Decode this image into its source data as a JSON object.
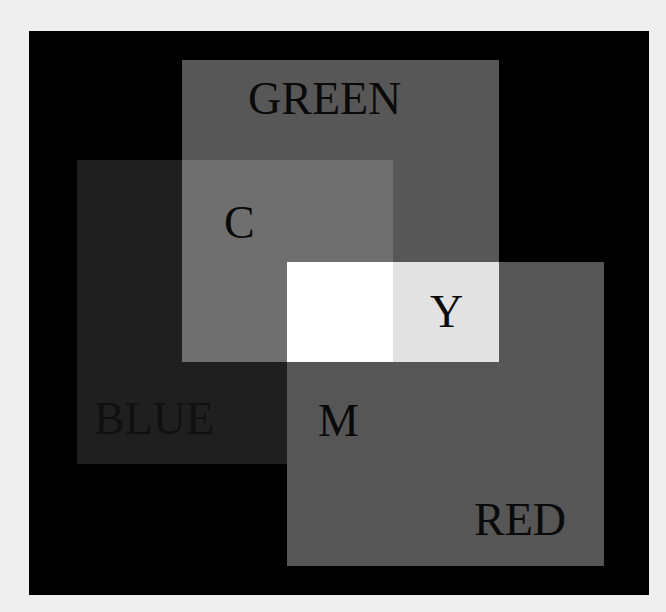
{
  "diagram": {
    "title": "",
    "labels": {
      "green": "GREEN",
      "blue": "BLUE",
      "red": "RED",
      "cyan": "C",
      "yellow": "Y",
      "magenta": "M"
    },
    "colors": {
      "page_background": "#efefef",
      "frame": "#000000",
      "green_only": "#575757",
      "blue_only": "#1f1f1f",
      "red_only": "#565656",
      "cyan_overlap": "#6f6f6f",
      "yellow_overlap": "#e2e2e2",
      "magenta_overlap": "#565656",
      "white_overlap": "#ffffff",
      "text": "#0a0a0a",
      "blue_text": "#101010"
    }
  }
}
